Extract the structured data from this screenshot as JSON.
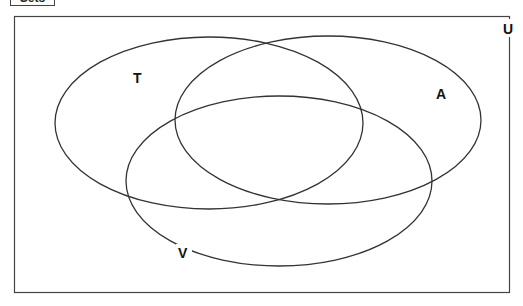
{
  "header": {
    "title": "Sets"
  },
  "diagram": {
    "universe_label": "U",
    "sets": [
      {
        "label": "T",
        "cx": 209,
        "cy": 123,
        "rx": 154,
        "ry": 86,
        "label_x": 138,
        "label_y": 81
      },
      {
        "label": "A",
        "cx": 328,
        "cy": 120,
        "rx": 153,
        "ry": 84,
        "label_x": 442,
        "label_y": 97
      },
      {
        "label": "V",
        "cx": 279,
        "cy": 181,
        "rx": 153,
        "ry": 85,
        "label_x": 183,
        "label_y": 257
      }
    ],
    "stroke_color": "#333333"
  }
}
